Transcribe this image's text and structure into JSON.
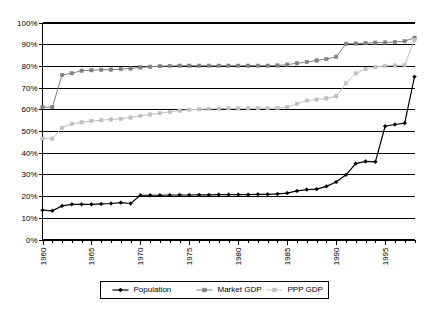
{
  "chart_data": {
    "type": "line",
    "title": "",
    "subtitle": "",
    "xlabel": "",
    "ylabel": "",
    "xlim": [
      1960,
      1998
    ],
    "ylim": [
      0,
      1
    ],
    "grid": true,
    "grid_axis": "y",
    "legend_position": "bottom",
    "x": [
      1960,
      1961,
      1962,
      1963,
      1964,
      1965,
      1966,
      1967,
      1968,
      1969,
      1970,
      1971,
      1972,
      1973,
      1974,
      1975,
      1976,
      1977,
      1978,
      1979,
      1980,
      1981,
      1982,
      1983,
      1984,
      1985,
      1986,
      1987,
      1988,
      1989,
      1990,
      1991,
      1992,
      1993,
      1994,
      1995,
      1996,
      1997,
      1998
    ],
    "xtick_labels": [
      "1960",
      "1965",
      "1970",
      "1975",
      "1980",
      "1985",
      "1990",
      "1995"
    ],
    "xtick_values": [
      1960,
      1965,
      1970,
      1975,
      1980,
      1985,
      1990,
      1995
    ],
    "ytick_labels": [
      "0%",
      "10%",
      "20%",
      "30%",
      "40%",
      "50%",
      "60%",
      "70%",
      "80%",
      "90%",
      "100%"
    ],
    "ytick_values": [
      0,
      10,
      20,
      30,
      40,
      50,
      60,
      70,
      80,
      90,
      100
    ],
    "series": [
      {
        "name": "Population",
        "color": "#000000",
        "marker": "diamond",
        "values": [
          13.5,
          13.2,
          15.5,
          16.2,
          16.2,
          16.2,
          16.4,
          16.6,
          17.0,
          16.6,
          20.4,
          20.4,
          20.4,
          20.5,
          20.5,
          20.5,
          20.6,
          20.6,
          20.7,
          20.7,
          20.7,
          20.7,
          20.8,
          20.8,
          21.0,
          21.4,
          22.4,
          23.0,
          23.2,
          24.5,
          26.5,
          29.8,
          35.0,
          36.0,
          35.8,
          52.2,
          53.0,
          53.6,
          75.0
        ]
      },
      {
        "name": "Market GDP",
        "color": "#808080",
        "marker": "square",
        "values": [
          61.0,
          61.0,
          75.8,
          76.6,
          77.8,
          78.0,
          78.2,
          78.3,
          78.5,
          78.8,
          79.3,
          79.6,
          79.9,
          80.0,
          80.1,
          80.1,
          80.1,
          80.1,
          80.1,
          80.1,
          80.1,
          80.1,
          80.1,
          80.1,
          80.2,
          80.6,
          81.2,
          81.8,
          82.5,
          83.2,
          84.2,
          90.2,
          90.3,
          90.5,
          90.7,
          90.8,
          91.0,
          91.4,
          93.0
        ]
      },
      {
        "name": "PPP GDP",
        "color": "#c0c0c0",
        "marker": "square",
        "values": [
          46.5,
          46.5,
          51.5,
          53.3,
          54.0,
          54.6,
          55.0,
          55.3,
          55.6,
          56.2,
          57.0,
          57.6,
          58.2,
          58.8,
          59.4,
          59.8,
          60.0,
          60.2,
          60.3,
          60.4,
          60.4,
          60.4,
          60.5,
          60.5,
          60.6,
          61.0,
          62.5,
          64.0,
          64.5,
          65.0,
          66.0,
          72.0,
          76.5,
          78.5,
          79.5,
          80.0,
          80.2,
          80.4,
          92.0
        ]
      }
    ],
    "legend": [
      {
        "label": "Population",
        "color": "#000000",
        "marker": "diamond"
      },
      {
        "label": "Market GDP",
        "color": "#808080",
        "marker": "square"
      },
      {
        "label": "PPP GDP",
        "color": "#c0c0c0",
        "marker": "square"
      }
    ]
  }
}
